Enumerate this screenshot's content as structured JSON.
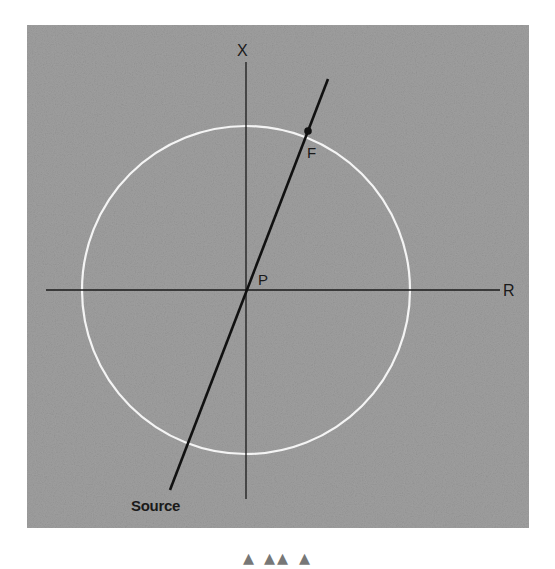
{
  "diagram": {
    "type": "geometric-figure",
    "panel": {
      "x": 27,
      "y": 25,
      "width": 502,
      "height": 503,
      "fill": "#9a9a9a"
    },
    "circle": {
      "cx": 246,
      "cy": 290,
      "r": 164,
      "stroke": "#f2f2f2"
    },
    "axes": {
      "vertical": {
        "x": 246,
        "y1": 62,
        "y2": 499,
        "label": "X"
      },
      "horizontal": {
        "y": 290,
        "x1": 46,
        "x2": 500,
        "label": "R"
      }
    },
    "line": {
      "x1": 170,
      "y1": 490,
      "x2": 328,
      "y2": 79,
      "color": "#111111"
    },
    "points": [
      {
        "id": "P",
        "label": "P",
        "x": 246,
        "y": 290
      },
      {
        "id": "F",
        "label": "F",
        "x": 308,
        "y": 131
      }
    ],
    "labels": {
      "x_axis": "X",
      "r_axis": "R",
      "point_p": "P",
      "point_f": "F",
      "source": "Source"
    }
  },
  "caption": {
    "text": "(truncated caption — only tops of letters visible)"
  }
}
